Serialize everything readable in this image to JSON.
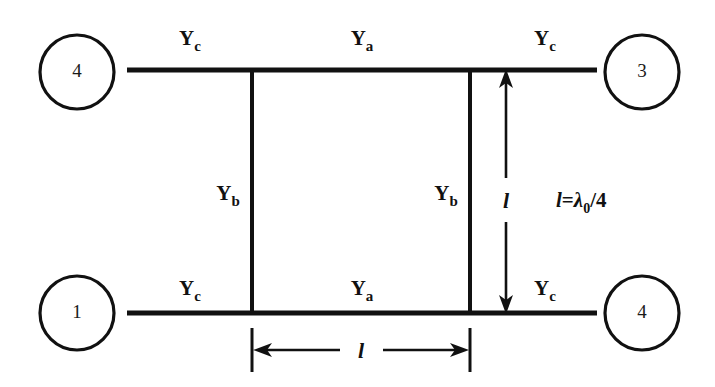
{
  "diagram": {
    "background_color": "#ffffff",
    "line_color": "#111111",
    "nodes": [
      {
        "id": "node-top-left",
        "label": "4",
        "cx": 77,
        "cy": 72,
        "r": 37
      },
      {
        "id": "node-top-right",
        "label": "3",
        "cx": 642,
        "cy": 72,
        "r": 37
      },
      {
        "id": "node-bottom-left",
        "label": "1",
        "cx": 77,
        "cy": 313,
        "r": 37
      },
      {
        "id": "node-bottom-right",
        "label": "4",
        "cx": 642,
        "cy": 313,
        "r": 37
      }
    ],
    "admittance_labels": [
      {
        "id": "yc-top-left",
        "base": "Y",
        "sub": "c",
        "x": 190,
        "y": 45
      },
      {
        "id": "ya-top",
        "base": "Y",
        "sub": "a",
        "x": 362,
        "y": 45
      },
      {
        "id": "yc-top-right",
        "base": "Y",
        "sub": "c",
        "x": 545,
        "y": 45
      },
      {
        "id": "yb-left",
        "base": "Y",
        "sub": "b",
        "x": 228,
        "y": 200
      },
      {
        "id": "yb-right",
        "base": "Y",
        "sub": "b",
        "x": 446,
        "y": 200
      },
      {
        "id": "yc-bottom-left",
        "base": "Y",
        "sub": "c",
        "x": 190,
        "y": 295
      },
      {
        "id": "ya-bottom",
        "base": "Y",
        "sub": "a",
        "x": 362,
        "y": 295
      },
      {
        "id": "yc-bottom-right",
        "base": "Y",
        "sub": "c",
        "x": 545,
        "y": 295
      }
    ],
    "length_labels": [
      {
        "id": "length-vertical",
        "text": "l",
        "x": 506,
        "y": 200
      },
      {
        "id": "length-horizontal",
        "text": "l",
        "x": 361,
        "y": 358
      }
    ],
    "equation": {
      "id": "wavelength-equation",
      "lhs": "l",
      "equals": "=",
      "symbol": "λ",
      "subscript": "0",
      "divider": "/",
      "denominator": "4",
      "x": 556,
      "y": 207
    }
  }
}
